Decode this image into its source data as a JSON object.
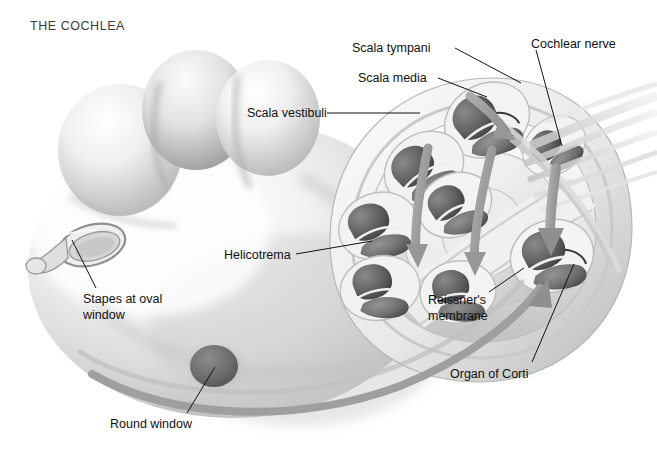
{
  "figure": {
    "title": "THE COCHLEA",
    "background_color": "#ffffff",
    "ink_color": "#111111",
    "title_color": "#3b3b3b"
  },
  "palette": {
    "body_light": "#fdfdfd",
    "body_mid": "#d8d8d8",
    "body_shade": "#a8a8a8",
    "body_deep": "#7f7f7f",
    "chamber_dark": "#5a5a5a",
    "chamber_darker": "#454545",
    "chamber_mid": "#6f6f6f",
    "round_window": "#6e6e6e",
    "arrow_gray": "#9a9a9a",
    "nerve_gray": "#cfcfcf",
    "leader_line": "#111111"
  },
  "labels": [
    {
      "id": "scala-tympani",
      "text": "Scala tympani",
      "x": 352,
      "y": 41,
      "align": "left",
      "leader": {
        "x1": 455,
        "y1": 48,
        "x2": 521,
        "y2": 83
      }
    },
    {
      "id": "scala-media",
      "text": "Scala media",
      "x": 358,
      "y": 71,
      "align": "left",
      "leader": {
        "x1": 438,
        "y1": 78,
        "x2": 487,
        "y2": 97
      }
    },
    {
      "id": "scala-vestibuli",
      "text": "Scala vestibuli",
      "x": 247,
      "y": 106,
      "align": "left",
      "leader": {
        "x1": 327,
        "y1": 113,
        "x2": 420,
        "y2": 113
      }
    },
    {
      "id": "cochlear-nerve",
      "text": "Cochlear nerve",
      "x": 531,
      "y": 37,
      "align": "left",
      "leader": {
        "x1": 536,
        "y1": 50,
        "x2": 562,
        "y2": 146
      }
    },
    {
      "id": "helicotrema",
      "text": "Helicotrema",
      "x": 224,
      "y": 248,
      "align": "left",
      "leader": {
        "x1": 296,
        "y1": 254,
        "x2": 372,
        "y2": 241
      }
    },
    {
      "id": "stapes-at-oval-window",
      "text": "Stapes at oval\nwindow",
      "x": 83,
      "y": 292,
      "align": "left",
      "leader": {
        "x1": 96,
        "y1": 288,
        "x2": 72,
        "y2": 240
      }
    },
    {
      "id": "reissners-membrane",
      "text": "Reissner's\nmembrane",
      "x": 428,
      "y": 293,
      "align": "left",
      "leader": {
        "x1": 489,
        "y1": 292,
        "x2": 524,
        "y2": 268
      }
    },
    {
      "id": "organ-of-corti",
      "text": "Organ of Corti",
      "x": 450,
      "y": 367,
      "align": "left",
      "leader": {
        "x1": 532,
        "y1": 362,
        "x2": 574,
        "y2": 264
      }
    },
    {
      "id": "round-window",
      "text": "Round window",
      "x": 110,
      "y": 417,
      "align": "left",
      "leader": {
        "x1": 187,
        "y1": 413,
        "x2": 215,
        "y2": 367
      }
    }
  ],
  "anatomy": {
    "round_window": {
      "cx": 214,
      "cy": 366,
      "rx": 24,
      "ry": 21
    },
    "oval_window": {
      "cx": 92,
      "cy": 245,
      "rx": 33,
      "ry": 19,
      "rotation": -18
    },
    "spiral_turns": 3,
    "cross_sections": 8,
    "flow_arrows": 5
  }
}
